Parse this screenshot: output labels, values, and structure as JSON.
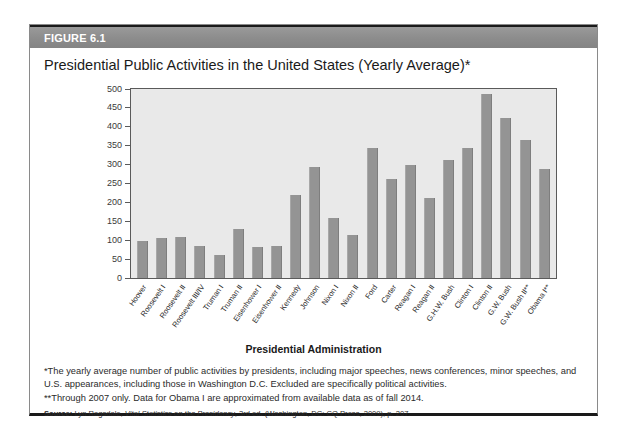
{
  "figure": {
    "label": "FIGURE 6.1",
    "title": "Presidential Public Activities in the United States (Yearly Average)*"
  },
  "notes": {
    "note1": "*The yearly average number of public activities by presidents, including major speeches, news conferences, minor speeches, and U.S. appearances, including those in Washington D.C. Excluded are specifically political activities.",
    "note2": "**Through 2007 only. Data for Obama I are approximated from available data as of fall 2014.",
    "source_label": "Source:",
    "source_pre": " Lyn Ragsdale, ",
    "source_italic": "Vital Statistics on the Presidency",
    "source_post": ", 3rd ed. (Washington, DC: CQ Press, 2009), p. 207."
  },
  "colors": {
    "bar": "#949494",
    "plot_background": "#e9e9e9",
    "header_band": "#8d8d8d",
    "frame": "#5a5a5a"
  },
  "chart_data": {
    "type": "bar",
    "title": "Presidential Public Activities in the United States (Yearly Average)*",
    "xlabel": "Presidential Administration",
    "ylabel": "",
    "ylim": [
      0,
      500
    ],
    "yticks": [
      0,
      50,
      100,
      150,
      200,
      250,
      300,
      350,
      400,
      450,
      500
    ],
    "grid": false,
    "legend": "none",
    "categories": [
      "Hoover",
      "Roosevelt I",
      "Roosevelt II",
      "Roosevelt III/IV",
      "Truman I",
      "Truman II",
      "Eisenhower I",
      "Eisenhower II",
      "Kennedy",
      "Johnson",
      "Nixon I",
      "Nixon II",
      "Ford",
      "Carter",
      "Reagan I",
      "Reagan II",
      "G.H.W. Bush",
      "Clinton I",
      "Clinton II",
      "G.W. Bush",
      "G.W. Bush II**",
      "Obama I**"
    ],
    "values": [
      99,
      106,
      109,
      85,
      62,
      130,
      83,
      86,
      220,
      293,
      159,
      114,
      345,
      261,
      299,
      213,
      311,
      343,
      488,
      422,
      365,
      289
    ]
  }
}
